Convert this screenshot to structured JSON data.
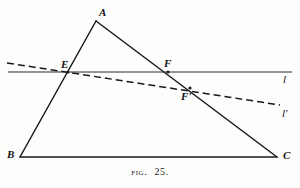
{
  "figure": {
    "caption_prefix": "Fig.",
    "caption_number": "25.",
    "caption_full": "Fig. 25.",
    "stroke_color": "#1a1a1a",
    "background_color": "#fdfdfb",
    "points": {
      "A": {
        "label": "A",
        "x": 96,
        "y": 21,
        "label_x": 99,
        "label_y": 7
      },
      "B": {
        "label": "B",
        "x": 20,
        "y": 157,
        "label_x": 7,
        "label_y": 149
      },
      "C": {
        "label": "C",
        "x": 277,
        "y": 157,
        "label_x": 283,
        "label_y": 150
      },
      "E": {
        "label": "E",
        "x": 68,
        "y": 72,
        "label_x": 61,
        "label_y": 59
      },
      "F": {
        "label": "F",
        "x": 168,
        "y": 72,
        "label_x": 164,
        "label_y": 58
      },
      "Fprime": {
        "label": "F'",
        "x": 190,
        "y": 88,
        "label_x": 181,
        "label_y": 91
      }
    },
    "segments": [
      {
        "name": "side-AB",
        "from": "A",
        "to": "B",
        "style": "solid"
      },
      {
        "name": "side-AC",
        "from": "A",
        "to": "C",
        "style": "solid"
      },
      {
        "name": "side-BC",
        "from": "B",
        "to": "C",
        "style": "solid"
      }
    ],
    "lines": {
      "l": {
        "label": "l",
        "style": "solid",
        "x1": 8,
        "y1": 72,
        "x2": 292,
        "y2": 72,
        "label_x": 283,
        "label_y": 74
      },
      "l_prime": {
        "label": "l'",
        "style": "dashed",
        "x1": 7,
        "y1": 63,
        "x2": 280,
        "y2": 105,
        "label_x": 282,
        "label_y": 108
      }
    }
  }
}
